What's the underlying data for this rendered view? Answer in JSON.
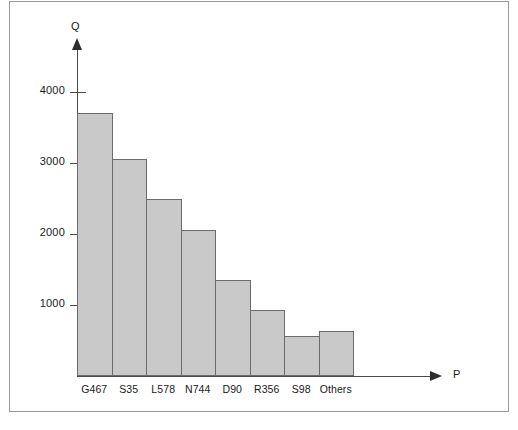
{
  "chart_data": {
    "type": "bar",
    "title": "",
    "subtitle": "",
    "xlabel": "P",
    "ylabel": "Q",
    "categories": [
      "G467",
      "S35",
      "L578",
      "N744",
      "D90",
      "R356",
      "S98",
      "Others"
    ],
    "values": [
      3700,
      3050,
      2500,
      2050,
      1350,
      930,
      560,
      640
    ],
    "ytick_labels": [
      "4000",
      "3000",
      "2000",
      "1000"
    ],
    "ytick_values": [
      4000,
      3000,
      2000,
      1000
    ],
    "ylim": [
      0,
      4350
    ],
    "xlim_note": "categorical, contiguous bars",
    "grid": false,
    "legend": null,
    "legend_position": "none",
    "bar_style": "contiguous-histogram",
    "colors": {
      "bar_fill": "#c9c9c9",
      "bar_stroke": "#6b6b6b",
      "axis": "#4a4a4a",
      "text": "#1a1a1a",
      "frame": "#9a9a9a",
      "background": "#ffffff"
    },
    "axes": {
      "y": {
        "title": "Q",
        "arrow": true,
        "arrow_direction": "up"
      },
      "x": {
        "title": "P",
        "arrow": true,
        "arrow_direction": "right"
      }
    }
  }
}
